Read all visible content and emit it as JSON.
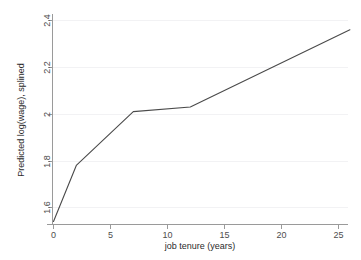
{
  "chart_data": {
    "type": "line",
    "title": "",
    "subtitle": "",
    "xlabel": "job tenure (years)",
    "ylabel": "Predicted log(wage), splined",
    "xlim": [
      0,
      26
    ],
    "ylim": [
      1.52,
      2.42
    ],
    "xticks": [
      0,
      5,
      10,
      15,
      20,
      25
    ],
    "xticklabels": [
      "0",
      "5",
      "10",
      "15",
      "20",
      "25"
    ],
    "yticks": [
      1.6,
      1.8,
      2.0,
      2.2,
      2.4
    ],
    "yticklabels": [
      "1.6",
      "1.8",
      "2",
      "2.2",
      "2.4"
    ],
    "grid": "horizontal",
    "legend": "none",
    "series": [
      {
        "name": "Predicted log(wage), splined",
        "color": "#4a4a4a",
        "x": [
          0,
          2,
          7,
          12,
          26
        ],
        "values": [
          1.54,
          1.78,
          2.01,
          2.03,
          2.36
        ]
      }
    ],
    "annotations": []
  },
  "figure": {
    "background_color": "#ffffff",
    "axis_color": "#9a9a9a",
    "grid_color": "#f2f2f4",
    "text_color": "#4d4d4d"
  }
}
